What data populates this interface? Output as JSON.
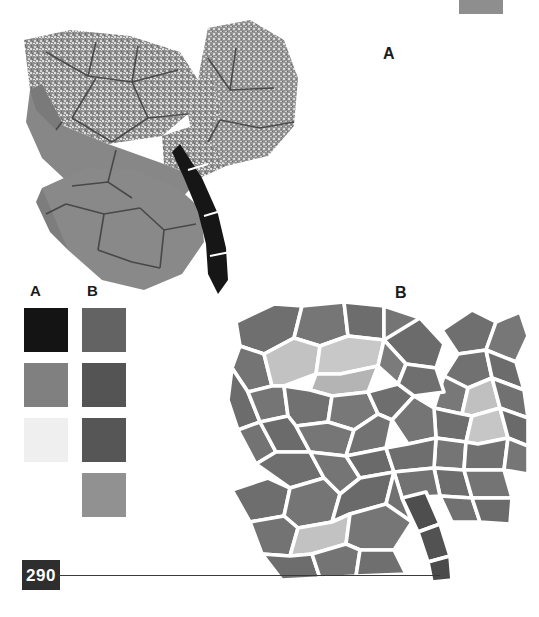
{
  "page": {
    "number": "290",
    "background": "#ffffff",
    "rule_color": "#3a3a3a",
    "plate_color": "#2e2e2e"
  },
  "figures": [
    {
      "id": "leaf-a",
      "label": "A",
      "description": "ivy-shaped leaf, speckled upper lobes, solid gray lower lobe, dark stem",
      "style": "speckled-mottled",
      "vein_line_color": "#3a3a3a",
      "palette": {
        "speckle_light": "#d8d8d8",
        "speckle_dark": "#7e7e7e",
        "solid_gray": "#8a8a8a",
        "solid_gray_dark": "#787878",
        "stem": "#151515"
      }
    },
    {
      "id": "leaf-b",
      "label": "B",
      "description": "ivy-shaped leaf rendered as mosaic tiles separated by white gaps",
      "style": "mosaic-tiles",
      "gap_color": "#ffffff",
      "palette": {
        "tile_mid": "#7c7c7c",
        "tile_dark": "#6a6a6a",
        "tile_light": "#bcbcbc",
        "tile_lighter": "#cfcfcf",
        "stem": "#4e4e4e"
      }
    }
  ],
  "legend": {
    "columns": [
      {
        "header": "A",
        "swatches": [
          {
            "name": "a-swatch-1",
            "color": "#141414"
          },
          {
            "name": "a-swatch-2",
            "color": "#808080"
          },
          {
            "name": "a-swatch-3",
            "color": "#efefef"
          }
        ]
      },
      {
        "header": "B",
        "swatches": [
          {
            "name": "b-swatch-1",
            "color": "#636363"
          },
          {
            "name": "b-swatch-2",
            "color": "#545454"
          },
          {
            "name": "b-swatch-3",
            "color": "#565656"
          },
          {
            "name": "b-swatch-4",
            "color": "#919191"
          }
        ]
      }
    ]
  },
  "corner_swatch": {
    "name": "corner-swatch",
    "color": "#8e8e8e"
  }
}
